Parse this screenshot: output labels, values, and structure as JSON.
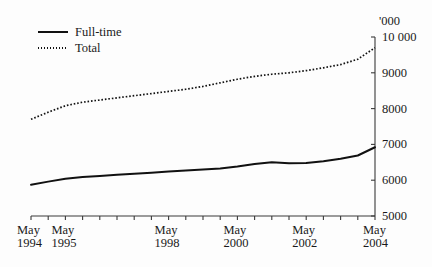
{
  "chart_data": {
    "type": "line",
    "title": "",
    "subtitle": "",
    "xlabel": "",
    "ylabel": "",
    "unit_label": "'000",
    "ylim": [
      5000,
      10000
    ],
    "y_ticks": [
      5000,
      6000,
      7000,
      8000,
      9000,
      10000
    ],
    "y_tick_labels": [
      "5000",
      "6000",
      "7000",
      "8000",
      "9000",
      "10 000"
    ],
    "grid": false,
    "legend_position": "top-left",
    "x_tick_labels": [
      {
        "month": "May",
        "year": "1994"
      },
      {
        "month": "May",
        "year": "1995"
      },
      {
        "month": "May",
        "year": "1998"
      },
      {
        "month": "May",
        "year": "2000"
      },
      {
        "month": "May",
        "year": "2002"
      },
      {
        "month": "May",
        "year": "2004"
      }
    ],
    "x": [
      1994.33,
      1994.83,
      1995.33,
      1995.83,
      1996.33,
      1996.83,
      1997.33,
      1997.83,
      1998.33,
      1998.83,
      1999.33,
      1999.83,
      2000.33,
      2000.83,
      2001.33,
      2001.83,
      2002.33,
      2002.83,
      2003.33,
      2003.83,
      2004.33
    ],
    "series": [
      {
        "name": "Full-time",
        "style": "solid",
        "color": "#111111",
        "values": [
          5870,
          5960,
          6040,
          6090,
          6120,
          6150,
          6180,
          6210,
          6240,
          6270,
          6300,
          6330,
          6380,
          6450,
          6500,
          6470,
          6480,
          6530,
          6600,
          6690,
          6920
        ]
      },
      {
        "name": "Total",
        "style": "dotted",
        "color": "#111111",
        "values": [
          7700,
          7900,
          8080,
          8180,
          8240,
          8300,
          8360,
          8420,
          8480,
          8540,
          8620,
          8720,
          8820,
          8900,
          8960,
          9000,
          9060,
          9140,
          9230,
          9380,
          9700
        ]
      }
    ]
  },
  "legend": {
    "items": [
      {
        "label": "Full-time",
        "style": "solid"
      },
      {
        "label": "Total",
        "style": "dotted"
      }
    ]
  }
}
